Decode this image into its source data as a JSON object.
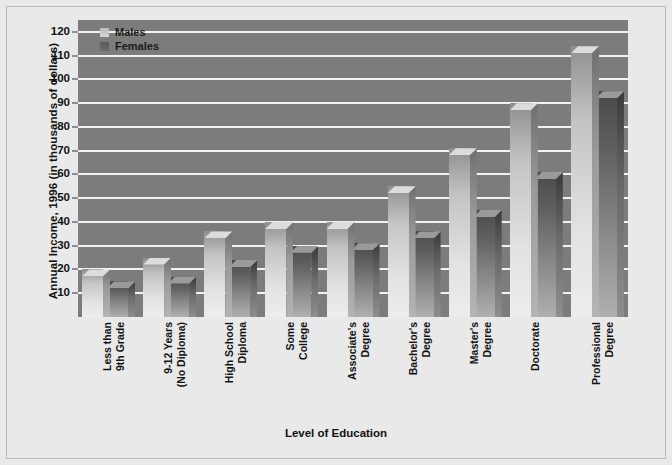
{
  "chart_data": {
    "type": "bar",
    "title": "",
    "xlabel": "Level of Education",
    "ylabel": "Annual Income, 1996 (in thousands of dollars)",
    "ylim": [
      0,
      125
    ],
    "yticks": [
      10,
      20,
      30,
      40,
      50,
      60,
      70,
      80,
      90,
      100,
      110,
      120
    ],
    "grid": true,
    "legend_position": "top-left",
    "categories": [
      "Less than 9th Grade",
      "9-12 Years (No Diploma)",
      "High School Diploma",
      "Some College",
      "Associate's Degree",
      "Bachelor's Degree",
      "Master's Degree",
      "Doctorate",
      "Professional Degree"
    ],
    "category_lines": [
      [
        "Less than",
        "9th Grade"
      ],
      [
        "9-12 Years",
        "(No Diploma)"
      ],
      [
        "High School",
        "Diploma"
      ],
      [
        "Some",
        "College"
      ],
      [
        "Associate's",
        "Degree"
      ],
      [
        "Bachelor's",
        "Degree"
      ],
      [
        "Master's",
        "Degree"
      ],
      [
        "Doctorate",
        ""
      ],
      [
        "Professional",
        "Degree"
      ]
    ],
    "series": [
      {
        "name": "Males",
        "color": "#d6d6d6",
        "values": [
          20,
          25,
          36,
          40,
          40,
          55,
          71,
          90,
          114
        ]
      },
      {
        "name": "Females",
        "color": "#5f5f5f",
        "values": [
          15,
          17,
          24,
          30,
          31,
          36,
          45,
          61,
          95
        ]
      }
    ]
  },
  "legend": {
    "items": [
      {
        "label": "Males"
      },
      {
        "label": "Females"
      }
    ]
  },
  "colors": {
    "plot_background": "#7c7c7c",
    "page_background": "#e9e9e9",
    "gridline": "#f2f2f2",
    "text": "#111111"
  }
}
